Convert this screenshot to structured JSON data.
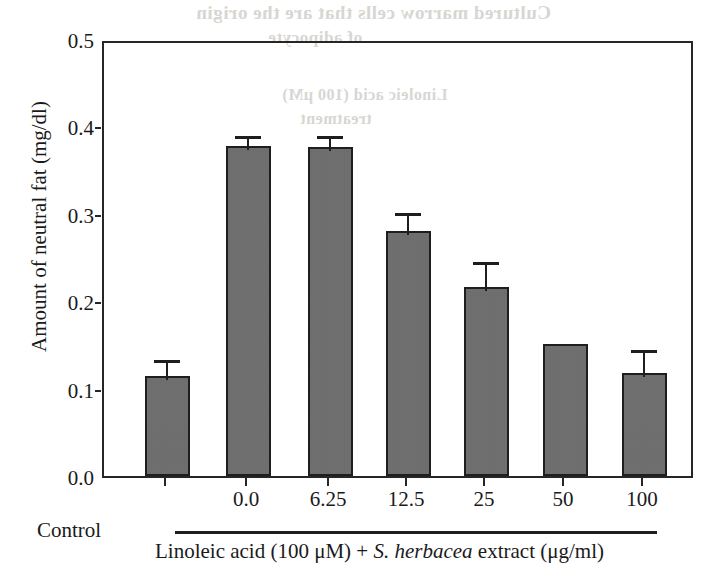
{
  "figure": {
    "bleed_through_text": [
      "Cultured marrow cells that are the origin",
      "of adipocyte",
      "Linoleic acid (100 μM)",
      "treatment"
    ]
  },
  "axes": {
    "y_title": "Amount of neutral fat (mg/dl)",
    "y_ticks": [
      "0.0",
      "0.1",
      "0.2",
      "0.3",
      "0.4",
      "0.5"
    ],
    "x_control_label": "Control",
    "x_caption_prefix": "Linoleic acid (100 μM) + ",
    "x_caption_species": "S. herbacea",
    "x_caption_suffix": " extract (μg/ml)"
  },
  "colors": {
    "bar_fill": "#6e6e6e",
    "bar_edge": "#1e1e1e",
    "axis": "#262626",
    "background": "#ffffff",
    "bleed": "#d8d6d2"
  },
  "chart_data": {
    "type": "bar",
    "title": "",
    "xlabel": "Linoleic acid (100 μM) + S. herbacea extract (μg/ml)",
    "ylabel": "Amount of neutral fat (mg/dl)",
    "ylim": [
      0.0,
      0.5
    ],
    "ytick_step": 0.1,
    "grid": false,
    "legend": "none",
    "categories": [
      "Control",
      "0.0",
      "6.25",
      "12.5",
      "25",
      "50",
      "100"
    ],
    "values": [
      0.115,
      0.378,
      0.376,
      0.28,
      0.216,
      0.151,
      0.118
    ],
    "errors": [
      0.014,
      0.008,
      0.01,
      0.017,
      0.025,
      0.0,
      0.023
    ],
    "bars": [
      {
        "category": "Control",
        "value": 0.115,
        "error": 0.014,
        "has_error_bar": true
      },
      {
        "category": "0.0",
        "value": 0.378,
        "error": 0.008,
        "has_error_bar": true
      },
      {
        "category": "6.25",
        "value": 0.376,
        "error": 0.01,
        "has_error_bar": true
      },
      {
        "category": "12.5",
        "value": 0.28,
        "error": 0.017,
        "has_error_bar": true
      },
      {
        "category": "25",
        "value": 0.216,
        "error": 0.025,
        "has_error_bar": true
      },
      {
        "category": "50",
        "value": 0.151,
        "error": 0.0,
        "has_error_bar": false
      },
      {
        "category": "100",
        "value": 0.118,
        "error": 0.023,
        "has_error_bar": true
      }
    ]
  }
}
